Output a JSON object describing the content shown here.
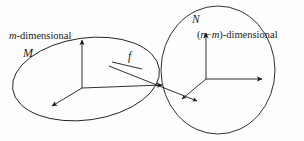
{
  "figure": {
    "background_color": "#fefefe",
    "stroke_color": "#1a1a1a",
    "width": 304,
    "height": 141
  },
  "labels": {
    "m_dimensional": "m-dimensional",
    "m_dimensional_parts": {
      "variable": "m",
      "suffix": "-dimensional"
    },
    "manifold_source": "M",
    "map": "f",
    "manifold_target": "N",
    "nm_dimensional": "(n−m)-dimensional",
    "nm_dimensional_parts": {
      "open_paren": "(",
      "var_n": "n",
      "minus": "−",
      "var_m": "m",
      "close_paren": ")",
      "suffix": "-dimensional"
    }
  },
  "shapes": {
    "source_ellipse": {
      "name": "M",
      "cx": 86,
      "cy": 79,
      "rx": 74,
      "ry": 41,
      "rotation": -8
    },
    "target_ellipse": {
      "name": "N",
      "cx": 218,
      "cy": 70,
      "rx": 57,
      "ry": 64,
      "rotation": 0
    }
  },
  "frames": {
    "source_frame": {
      "origin_x": 82,
      "origin_y": 88,
      "axes": [
        {
          "name": "vertical-axis",
          "dx": 0,
          "dy": -50
        },
        {
          "name": "horizontal-axis",
          "dx": 83,
          "dy": -3
        },
        {
          "name": "depth-axis",
          "dx": -32,
          "dy": 19
        }
      ]
    },
    "target_frame": {
      "origin_x": 206,
      "origin_y": 79,
      "axes": [
        {
          "name": "vertical-axis",
          "dx": 0,
          "dy": -48
        },
        {
          "name": "horizontal-axis",
          "dx": 58,
          "dy": 0
        },
        {
          "name": "depth-axis",
          "dx": -26,
          "dy": 21
        }
      ]
    }
  },
  "map_arrow": {
    "name": "f",
    "start_x": 109,
    "start_y": 67,
    "end_x": 196,
    "end_y": 101
  }
}
